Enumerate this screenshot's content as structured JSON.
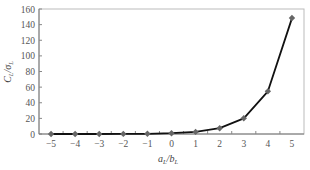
{
  "chart_data": {
    "type": "line",
    "title": "",
    "xlabel": "a_L/b_L",
    "ylabel": "C_L/σ_L",
    "x": [
      -5,
      -4,
      -3,
      -2,
      -1,
      0,
      1,
      2,
      3,
      4,
      5
    ],
    "series": [
      {
        "name": "C_L/σ_L",
        "values": [
          0.0,
          0.0,
          0.0,
          0.1,
          0.3,
          1.0,
          2.7,
          7.4,
          20.1,
          54.6,
          148.4
        ],
        "color": "#111111",
        "marker": "diamond",
        "marker_color": "#666666"
      }
    ],
    "xticks": [
      "-5",
      "-4",
      "-3",
      "-2",
      "-1",
      "0",
      "1",
      "2",
      "3",
      "4",
      "5"
    ],
    "yticks": [
      "0",
      "20",
      "40",
      "60",
      "80",
      "100",
      "120",
      "140",
      "160"
    ],
    "xlim": [
      -5.5,
      5.5
    ],
    "ylim": [
      0,
      160
    ],
    "grid": false,
    "legend": "none"
  },
  "labels": {
    "x_main": "a",
    "x_sub": "L",
    "x_sep": "/b",
    "x_sub2": "L",
    "y_main": "C",
    "y_sub": "L",
    "y_sep": "/σ",
    "y_sub2": "L"
  }
}
